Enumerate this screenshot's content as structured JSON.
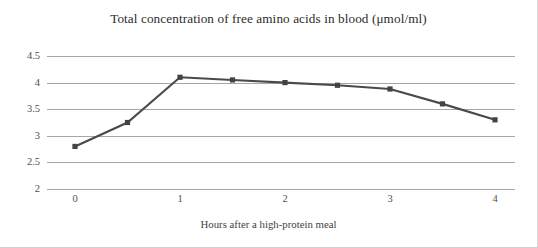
{
  "chart_data": {
    "type": "line",
    "title": "Total concentration of free amino acids in blood (μmol/ml)",
    "xlabel": "Hours after a high-protein meal",
    "ylabel": "",
    "x": [
      0,
      0.5,
      1,
      1.5,
      2,
      2.5,
      3,
      3.5,
      4
    ],
    "values": [
      2.8,
      3.25,
      4.1,
      4.05,
      4.0,
      3.95,
      3.88,
      3.6,
      3.3
    ],
    "series": [
      {
        "name": "Total free amino acids",
        "values": [
          2.8,
          3.25,
          4.1,
          4.05,
          4.0,
          3.95,
          3.88,
          3.6,
          3.3
        ]
      }
    ],
    "xlim": [
      0,
      4
    ],
    "ylim": [
      2,
      4.5
    ],
    "xticks": [
      "0",
      "1",
      "2",
      "3",
      "4"
    ],
    "xtick_values": [
      0,
      1,
      2,
      3,
      4
    ],
    "yticks": [
      "2",
      "2.5",
      "3",
      "3.5",
      "4",
      "4.5"
    ],
    "ytick_values": [
      2,
      2.5,
      3,
      3.5,
      4,
      4.5
    ],
    "grid": "horizontal",
    "legend": "none",
    "marker": "square",
    "line_color": "#4a4a4a",
    "marker_color": "#434343",
    "gridline_color": "#a6a6a6",
    "text_color": "#3f3f3f"
  }
}
